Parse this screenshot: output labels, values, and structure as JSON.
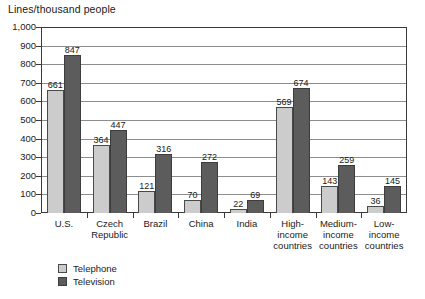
{
  "chart_data": {
    "type": "bar",
    "title": "",
    "ylabel": "Lines/thousand people",
    "xlabel": "",
    "ylim": [
      0,
      1000
    ],
    "ytick_step": 100,
    "grid": true,
    "legend_position": "bottom-left",
    "categories": [
      "U.S.",
      "Czech Republic",
      "Brazil",
      "China",
      "India",
      "High-income countries",
      "Medium-income countries",
      "Low-income countries"
    ],
    "category_lines": [
      [
        "U.S."
      ],
      [
        "Czech",
        "Republic"
      ],
      [
        "Brazil"
      ],
      [
        "China"
      ],
      [
        "India"
      ],
      [
        "High-",
        "income",
        "countries"
      ],
      [
        "Medium-",
        "income",
        "countries"
      ],
      [
        "Low-",
        "income",
        "countries"
      ]
    ],
    "ytick_labels": [
      "1,000",
      "900",
      "800",
      "700",
      "600",
      "500",
      "400",
      "300",
      "200",
      "100",
      "0"
    ],
    "ytick_values": [
      1000,
      900,
      800,
      700,
      600,
      500,
      400,
      300,
      200,
      100,
      0
    ],
    "series": [
      {
        "name": "Telephone",
        "color": "#cccccc",
        "values": [
          661,
          364,
          121,
          70,
          22,
          569,
          143,
          36
        ]
      },
      {
        "name": "Television",
        "color": "#5c5c5c",
        "values": [
          847,
          447,
          316,
          272,
          69,
          674,
          259,
          145
        ]
      }
    ]
  },
  "legend": {
    "items": [
      {
        "label": "Telephone",
        "swatch": "telephone"
      },
      {
        "label": "Television",
        "swatch": "television"
      }
    ]
  }
}
